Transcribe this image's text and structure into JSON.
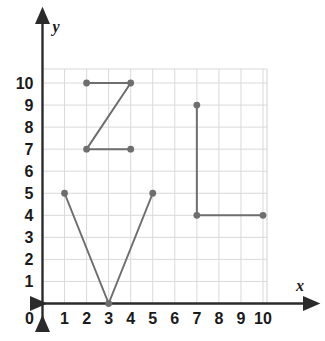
{
  "chart_data": {
    "type": "scatter",
    "title": "",
    "xlabel": "x",
    "ylabel": "y",
    "xlim": [
      0,
      10
    ],
    "ylim": [
      0,
      10
    ],
    "grid": true,
    "legend": "none",
    "x_ticks": [
      "0",
      "1",
      "2",
      "3",
      "4",
      "5",
      "6",
      "7",
      "8",
      "9",
      "10"
    ],
    "y_ticks": [
      "0",
      "1",
      "2",
      "3",
      "4",
      "5",
      "6",
      "7",
      "8",
      "9",
      "10"
    ],
    "x_tick_values": [
      0,
      1,
      2,
      3,
      4,
      5,
      6,
      7,
      8,
      9,
      10
    ],
    "y_tick_values": [
      0,
      1,
      2,
      3,
      4,
      5,
      6,
      7,
      8,
      9,
      10
    ],
    "series": [
      {
        "name": "letter-z",
        "points": [
          [
            2,
            10
          ],
          [
            4,
            10
          ],
          [
            2,
            7
          ],
          [
            4,
            7
          ]
        ],
        "closed": false
      },
      {
        "name": "letter-v",
        "points": [
          [
            1,
            5
          ],
          [
            3,
            0
          ],
          [
            5,
            5
          ]
        ],
        "closed": false
      },
      {
        "name": "letter-l",
        "points": [
          [
            7,
            9
          ],
          [
            7,
            4
          ],
          [
            10,
            4
          ]
        ],
        "closed": false
      }
    ],
    "all_points": [
      [
        2,
        10
      ],
      [
        4,
        10
      ],
      [
        2,
        7
      ],
      [
        4,
        7
      ],
      [
        1,
        5
      ],
      [
        3,
        0
      ],
      [
        5,
        5
      ],
      [
        7,
        9
      ],
      [
        7,
        4
      ],
      [
        10,
        4
      ]
    ]
  },
  "style": {
    "stroke_color": "#6e6e6e",
    "point_color": "#6e6e6e",
    "grid_color": "#d9d9d9",
    "axis_color": "#2b2b2b",
    "background": "#ffffff",
    "line_width": 2,
    "point_radius": 3.4
  },
  "axis_labels": {
    "x": "x",
    "y": "y"
  },
  "origin_label": "0"
}
